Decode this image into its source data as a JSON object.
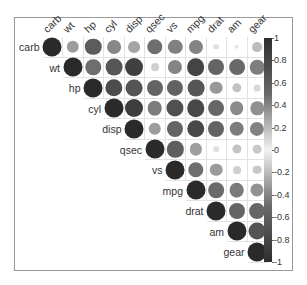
{
  "chart_data": {
    "type": "heatmap",
    "subtype": "correlation-matrix-upper-circle",
    "title": "",
    "variables": [
      "carb",
      "wt",
      "hp",
      "cyl",
      "disp",
      "qsec",
      "vs",
      "mpg",
      "drat",
      "am",
      "gear"
    ],
    "matrix": [
      [
        1,
        0.43,
        0.75,
        0.53,
        0.39,
        -0.66,
        -0.57,
        -0.55,
        -0.09,
        0.06,
        0.27
      ],
      [
        0.43,
        1,
        0.66,
        0.78,
        0.89,
        -0.17,
        -0.55,
        -0.87,
        -0.71,
        -0.69,
        -0.58
      ],
      [
        0.75,
        0.66,
        1,
        0.83,
        0.79,
        -0.71,
        -0.72,
        -0.78,
        -0.45,
        -0.24,
        -0.13
      ],
      [
        0.53,
        0.78,
        0.83,
        1,
        0.9,
        -0.59,
        -0.81,
        -0.85,
        -0.7,
        -0.52,
        -0.49
      ],
      [
        0.39,
        0.89,
        0.79,
        0.9,
        1,
        -0.43,
        -0.71,
        -0.85,
        -0.71,
        -0.59,
        -0.56
      ],
      [
        -0.66,
        -0.17,
        -0.71,
        -0.59,
        -0.43,
        1,
        0.74,
        0.42,
        0.09,
        -0.23,
        -0.21
      ],
      [
        -0.57,
        -0.55,
        -0.72,
        -0.81,
        -0.71,
        0.74,
        1,
        0.66,
        0.44,
        0.17,
        0.21
      ],
      [
        -0.55,
        -0.87,
        -0.78,
        -0.85,
        -0.85,
        0.42,
        0.66,
        1,
        0.68,
        0.6,
        0.48
      ],
      [
        -0.09,
        -0.71,
        -0.45,
        -0.7,
        -0.71,
        0.09,
        0.44,
        0.68,
        1,
        0.71,
        0.7
      ],
      [
        0.06,
        -0.69,
        -0.24,
        -0.52,
        -0.59,
        -0.23,
        0.17,
        0.6,
        0.71,
        1,
        0.79
      ],
      [
        0.27,
        -0.58,
        -0.13,
        -0.49,
        -0.56,
        -0.21,
        0.21,
        0.48,
        0.7,
        0.79,
        1
      ]
    ],
    "colorbar": {
      "ticks": [
        "1",
        "0.8",
        "0.6",
        "0.4",
        "0.2",
        "0",
        "-0.2",
        "-0.4",
        "-0.6",
        "-0.8",
        "-1"
      ],
      "range": [
        -1,
        1
      ]
    },
    "grid": true,
    "legend_position": "right"
  }
}
